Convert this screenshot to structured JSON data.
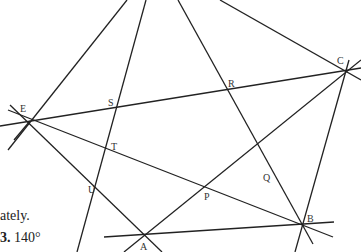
{
  "figure": {
    "type": "pentagram-construction",
    "points": [
      {
        "name": "E",
        "x": 30,
        "y": 121,
        "lx": 20,
        "ly": 112
      },
      {
        "name": "C",
        "x": 346,
        "y": 71,
        "lx": 337,
        "ly": 64
      },
      {
        "name": "B",
        "x": 300,
        "y": 225,
        "lx": 307,
        "ly": 222
      },
      {
        "name": "A",
        "x": 145,
        "y": 236,
        "lx": 140,
        "ly": 250
      },
      {
        "name": "S",
        "x": 117,
        "y": 109,
        "lx": 108,
        "ly": 106
      },
      {
        "name": "R",
        "x": 228,
        "y": 91,
        "lx": 228,
        "ly": 87
      },
      {
        "name": "Q",
        "x": 258,
        "y": 173,
        "lx": 263,
        "ly": 181
      },
      {
        "name": "P",
        "x": 205,
        "y": 188,
        "lx": 204,
        "ly": 200
      },
      {
        "name": "T",
        "x": 106,
        "y": 150,
        "lx": 111,
        "ly": 150
      },
      {
        "name": "U",
        "x": 97,
        "y": 186,
        "lx": 88,
        "ly": 193
      }
    ],
    "labels": {
      "E": "E",
      "C": "C",
      "B": "B",
      "A": "A",
      "S": "S",
      "R": "R",
      "Q": "Q",
      "P": "P",
      "T": "T",
      "U": "U"
    }
  },
  "text": {
    "fragment_1": "ately.",
    "fragment_2_num": "3.",
    "fragment_2_val": "140°"
  }
}
